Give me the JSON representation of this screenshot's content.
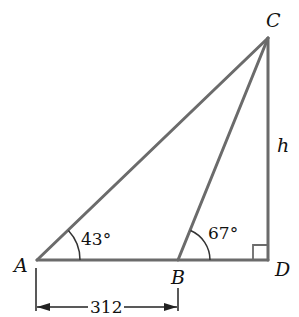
{
  "diagram": {
    "type": "triangle-geometry",
    "points": {
      "A": {
        "label": "A"
      },
      "B": {
        "label": "B"
      },
      "C": {
        "label": "C"
      },
      "D": {
        "label": "D"
      }
    },
    "angles": {
      "A": "43°",
      "B": "67°"
    },
    "lengths": {
      "AB": "312",
      "CD": "h"
    },
    "right_angle_at": "D",
    "line_color": "#6b6b6b"
  }
}
